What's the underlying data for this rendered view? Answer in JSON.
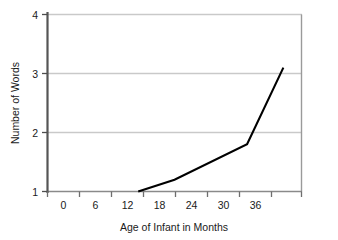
{
  "chart_data": {
    "type": "line",
    "title": "",
    "xlabel": "Age of Infant in Months",
    "ylabel": "Number of Words",
    "xlim": [
      -3,
      39
    ],
    "ylim": [
      1,
      4
    ],
    "xticks": [
      0,
      6,
      12,
      18,
      24,
      30,
      36
    ],
    "xtick_labels": [
      "0",
      "6",
      "12",
      "18",
      "24",
      "30",
      "36"
    ],
    "yticks": [
      1,
      2,
      3,
      4
    ],
    "ytick_labels": [
      "1",
      "2",
      "3",
      "4"
    ],
    "grid": "horizontal",
    "legend": "none",
    "series": [
      {
        "name": "Number of Words",
        "x": [
          12,
          18,
          30,
          36
        ],
        "values": [
          1.0,
          1.2,
          1.8,
          3.1
        ],
        "color": "#000000"
      }
    ]
  },
  "axis_labels": {
    "x_title": "Age of Infant in Months",
    "y_title": "Number of Words"
  },
  "y_ticks": [
    {
      "value": 4,
      "label": "4"
    },
    {
      "value": 3,
      "label": "3"
    },
    {
      "value": 2,
      "label": "2"
    },
    {
      "value": 1,
      "label": "1"
    }
  ],
  "x_ticks": [
    {
      "value": 0,
      "label": "0"
    },
    {
      "value": 6,
      "label": "6"
    },
    {
      "value": 12,
      "label": "12"
    },
    {
      "value": 18,
      "label": "18"
    },
    {
      "value": 24,
      "label": "24"
    },
    {
      "value": 30,
      "label": "30"
    },
    {
      "value": 36,
      "label": "36"
    }
  ],
  "colors": {
    "line": "#000000",
    "grid": "#c9c9c9",
    "axis": "#4d4d4d",
    "y_axis": "#555555",
    "text": "#1a1a1a",
    "background": "#ffffff"
  }
}
